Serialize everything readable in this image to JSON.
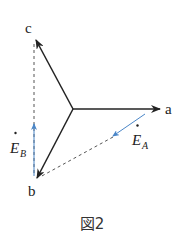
{
  "diagram": {
    "labels": {
      "a": "a",
      "b": "b",
      "c": "c",
      "EA_main": "E",
      "EA_sub": "A",
      "EB_main": "E",
      "EB_sub": "B"
    },
    "caption": "図2",
    "colors": {
      "phasor": "#222222",
      "blue": "#4a86c8",
      "dashed": "#555555"
    }
  }
}
